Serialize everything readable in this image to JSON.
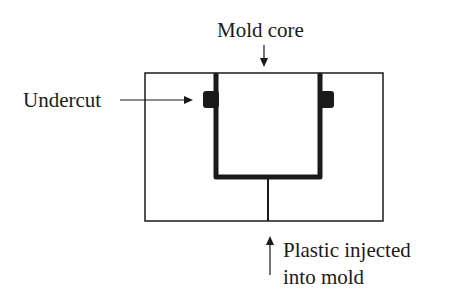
{
  "diagram": {
    "labels": {
      "mold_core": "Mold core",
      "undercut": "Undercut",
      "injection_line1": "Plastic injected",
      "injection_line2": "into mold"
    },
    "colors": {
      "stroke": "#1a1a1a",
      "background": "#ffffff"
    }
  }
}
